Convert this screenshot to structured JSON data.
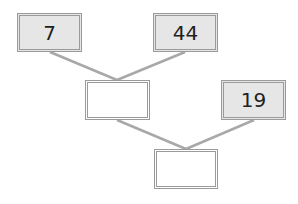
{
  "diagram": {
    "type": "addition-tree",
    "line_color": "#a8a8a8",
    "nodes": [
      {
        "id": "a",
        "value": "7",
        "filled": true
      },
      {
        "id": "b",
        "value": "44",
        "filled": true
      },
      {
        "id": "sum1",
        "value": "",
        "filled": false
      },
      {
        "id": "c",
        "value": "19",
        "filled": true
      },
      {
        "id": "sum2",
        "value": "",
        "filled": false
      }
    ],
    "edges": [
      [
        "a",
        "sum1"
      ],
      [
        "b",
        "sum1"
      ],
      [
        "sum1",
        "sum2"
      ],
      [
        "c",
        "sum2"
      ]
    ]
  }
}
